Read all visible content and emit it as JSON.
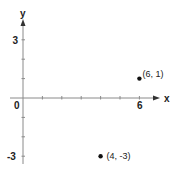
{
  "chart_data": {
    "type": "scatter",
    "title": "",
    "xlabel": "x",
    "ylabel": "y",
    "xlim": [
      0,
      6
    ],
    "ylim": [
      -3,
      3
    ],
    "grid": false,
    "x_tick_labels": [
      {
        "value": 6,
        "label": "6"
      }
    ],
    "y_tick_labels": [
      {
        "value": 3,
        "label": "3"
      },
      {
        "value": -3,
        "label": "-3"
      }
    ],
    "origin_label": "0",
    "x_ticks": [
      1,
      2,
      3,
      4,
      5,
      6
    ],
    "y_ticks": [
      -3,
      -2,
      -1,
      1,
      2,
      3
    ],
    "points": [
      {
        "x": 6,
        "y": 1,
        "label": "(6, 1)"
      },
      {
        "x": 4,
        "y": -3,
        "label": "(4, -3)"
      }
    ]
  },
  "colors": {
    "axis": "#8a8a8a",
    "point": "#111111",
    "text": "#222222"
  }
}
